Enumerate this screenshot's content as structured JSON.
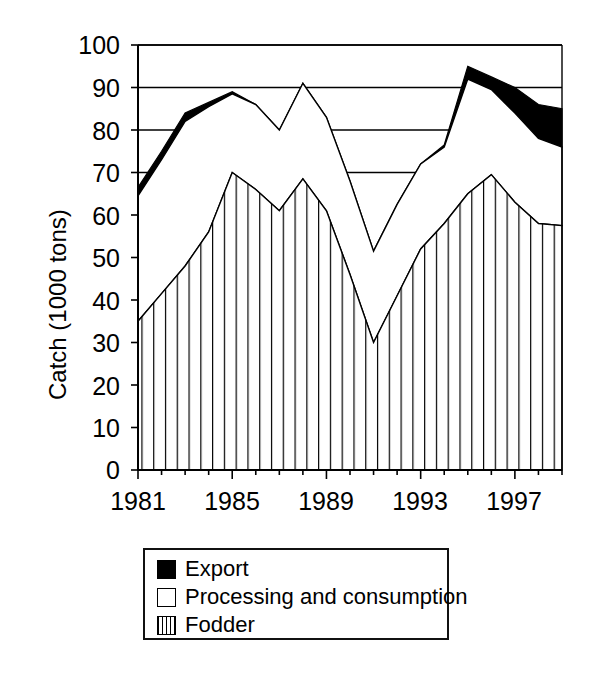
{
  "chart_data": {
    "type": "area",
    "title": "",
    "xlabel": "",
    "ylabel": "Catch (1000 tons)",
    "ylim": [
      0,
      100
    ],
    "ytick_step": 10,
    "yticks": [
      "0",
      "10",
      "20",
      "30",
      "40",
      "50",
      "60",
      "70",
      "80",
      "90",
      "100"
    ],
    "grid": true,
    "gridlines_at": [
      70,
      80,
      90,
      100
    ],
    "xlim": [
      1981,
      1999
    ],
    "x": [
      1981,
      1982,
      1983,
      1984,
      1985,
      1986,
      1987,
      1988,
      1989,
      1990,
      1991,
      1992,
      1993,
      1994,
      1995,
      1996,
      1997,
      1998,
      1999
    ],
    "xticks": [
      "1981",
      "1985",
      "1989",
      "1993",
      "1997"
    ],
    "xtick_values": [
      1981,
      1985,
      1989,
      1993,
      1997
    ],
    "stacked": true,
    "legend_position": "below",
    "series": [
      {
        "name": "Fodder",
        "fill": "vertical-hatch",
        "values": [
          35.0,
          41.5,
          48.0,
          56.0,
          70.0,
          66.0,
          61.0,
          68.5,
          61.0,
          46.0,
          30.0,
          41.0,
          52.0,
          58.0,
          65.0,
          69.5,
          63.0,
          58.0,
          57.5
        ]
      },
      {
        "name": "Processing and consumption",
        "fill": "white",
        "cumulative_top": [
          64.5,
          73.0,
          82.0,
          85.5,
          88.5,
          86.0,
          80.0,
          91.0,
          83.0,
          68.0,
          51.5,
          62.5,
          72.0,
          76.0,
          92.0,
          89.5,
          84.0,
          78.0,
          76.0
        ],
        "values": [
          29.5,
          31.5,
          34.0,
          29.5,
          18.5,
          20.0,
          19.0,
          22.5,
          22.0,
          22.0,
          21.5,
          21.5,
          20.0,
          18.0,
          27.0,
          20.0,
          21.0,
          20.0,
          18.5
        ]
      },
      {
        "name": "Export",
        "fill": "black",
        "cumulative_top": [
          66.5,
          75.0,
          84.0,
          86.5,
          89.0,
          86.0,
          80.0,
          91.0,
          83.0,
          68.0,
          51.5,
          62.5,
          72.0,
          76.5,
          95.0,
          92.5,
          90.0,
          86.0,
          85.0
        ],
        "values": [
          2.0,
          2.0,
          2.0,
          1.0,
          0.5,
          0.0,
          0.0,
          0.0,
          0.0,
          0.0,
          0.0,
          0.0,
          0.0,
          0.5,
          3.0,
          3.0,
          6.0,
          8.0,
          9.0
        ]
      }
    ]
  },
  "axis": {
    "y_title": "Catch (1000 tons)",
    "y_ticks": [
      {
        "label": "100",
        "value": 100
      },
      {
        "label": "90",
        "value": 90
      },
      {
        "label": "80",
        "value": 80
      },
      {
        "label": "70",
        "value": 70
      },
      {
        "label": "60",
        "value": 60
      },
      {
        "label": "50",
        "value": 50
      },
      {
        "label": "40",
        "value": 40
      },
      {
        "label": "30",
        "value": 30
      },
      {
        "label": "20",
        "value": 20
      },
      {
        "label": "10",
        "value": 10
      },
      {
        "label": "0",
        "value": 0
      }
    ],
    "x_ticks": [
      {
        "label": "1981",
        "value": 1981
      },
      {
        "label": "1985",
        "value": 1985
      },
      {
        "label": "1989",
        "value": 1989
      },
      {
        "label": "1993",
        "value": 1993
      },
      {
        "label": "1997",
        "value": 1997
      }
    ]
  },
  "legend": {
    "items": [
      {
        "label": "Export",
        "swatch": "black-square-icon"
      },
      {
        "label": "Processing and consumption",
        "swatch": "white-square-icon"
      },
      {
        "label": "Fodder",
        "swatch": "hatched-square-icon"
      }
    ]
  },
  "colors": {
    "ink": "#000000",
    "background": "#ffffff",
    "export_fill": "#000000",
    "processing_fill": "#ffffff",
    "fodder_hatch": "#000000"
  }
}
